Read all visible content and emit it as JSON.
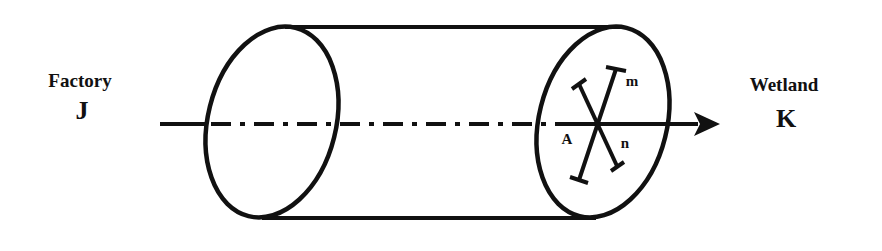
{
  "diagram": {
    "source": {
      "name": "Factory",
      "letter": "J"
    },
    "destination": {
      "name": "Wetland",
      "letter": "K"
    },
    "cross_section": {
      "point_label": "A",
      "axis_labels": [
        "m",
        "n"
      ]
    },
    "colors": {
      "stroke": "#111111",
      "background": "#ffffff"
    }
  }
}
